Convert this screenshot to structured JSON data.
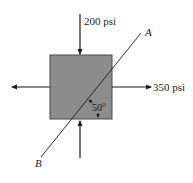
{
  "diagram": {
    "type": "stress-element",
    "element": {
      "fill": "#8c8c8c",
      "stroke": "#4a4a4a"
    },
    "loads": {
      "vertical": {
        "label": "200 psi",
        "direction": "compressive"
      },
      "horizontal": {
        "label": "350 psi",
        "direction": "tensile"
      }
    },
    "plane": {
      "end_top_label": "A",
      "end_bottom_label": "B",
      "angle_label": "50°"
    },
    "colors": {
      "line": "#1a1a1a",
      "background": "#ffffff"
    }
  }
}
